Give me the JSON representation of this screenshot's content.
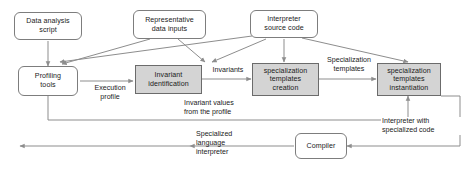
{
  "diagram": {
    "colors": {
      "process_fill": "#d4d4d4",
      "node_fill": "#ffffff",
      "stroke": "#7d7d7d",
      "text": "#1a1a1a"
    },
    "nodes": [
      {
        "id": "data-analysis-script",
        "label": "Data analysis\nscript",
        "shape": "rounded"
      },
      {
        "id": "representative-data-inputs",
        "label": "Representative\ndata inputs",
        "shape": "rounded"
      },
      {
        "id": "interpreter-source-code",
        "label": "Interpreter\nsource code",
        "shape": "rounded"
      },
      {
        "id": "profiling-tools",
        "label": "Profiling\ntools",
        "shape": "rounded"
      },
      {
        "id": "invariant-identification",
        "label": "Invariant\nidentification",
        "shape": "process"
      },
      {
        "id": "templates-creation",
        "label": "specialization\ntemplates\ncreation",
        "shape": "process"
      },
      {
        "id": "templates-instantiation",
        "label": "specialization\ntemplates\ninstantiation",
        "shape": "process"
      },
      {
        "id": "compiler",
        "label": "Compiler",
        "shape": "rounded"
      }
    ],
    "edge_labels": [
      {
        "id": "execution-profile",
        "text": "Execution\nprofile"
      },
      {
        "id": "invariants",
        "text": "Invariants"
      },
      {
        "id": "invariant-values",
        "text": "Invariant values\nfrom the profile"
      },
      {
        "id": "specialization-templates-1",
        "text": "Specialization\ntemplates"
      },
      {
        "id": "specialization-templates-2",
        "text": "Specialization\ntemplates"
      },
      {
        "id": "interpreter-specialized-code",
        "text": "Interpreter with\nspecialized code"
      }
    ],
    "outputs": [
      {
        "id": "specialized-language-interpreter",
        "text": "Specialized\nlanguage\ninterpreter"
      }
    ]
  }
}
